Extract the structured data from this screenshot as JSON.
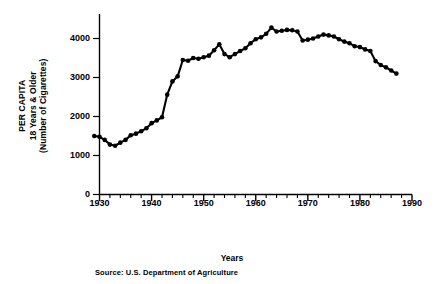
{
  "chart_data": {
    "type": "line",
    "title": "",
    "xlabel": "Years",
    "ylabel_lines": [
      "PER CAPITA",
      "18 Years & Older",
      "(Number of Cigarettes)"
    ],
    "ylabel": "PER CAPITA 18 Years & Older (Number of Cigarettes)",
    "source": "Source: U.S. Department of Agriculture",
    "xlim": [
      1928,
      1990
    ],
    "ylim": [
      0,
      4500
    ],
    "xticks": [
      1930,
      1940,
      1950,
      1960,
      1970,
      1980,
      1990
    ],
    "xtick_labels": [
      "1930",
      "1940",
      "1950",
      "1960",
      "1970",
      "1980",
      "1990"
    ],
    "minor_xtick_interval": 2,
    "yticks": [
      0,
      1000,
      2000,
      3000,
      4000
    ],
    "ytick_labels": [
      "0",
      "1000",
      "2000",
      "3000",
      "4000"
    ],
    "grid": false,
    "legend": null,
    "marker": "filled-circle",
    "line_color": "#000000",
    "series": [
      {
        "name": "Per capita cigarette consumption",
        "x": [
          1929,
          1930,
          1931,
          1932,
          1933,
          1934,
          1935,
          1936,
          1937,
          1938,
          1939,
          1940,
          1941,
          1942,
          1943,
          1944,
          1945,
          1946,
          1947,
          1948,
          1949,
          1950,
          1951,
          1952,
          1953,
          1954,
          1955,
          1956,
          1957,
          1958,
          1959,
          1960,
          1961,
          1962,
          1963,
          1964,
          1965,
          1966,
          1967,
          1968,
          1969,
          1970,
          1971,
          1972,
          1973,
          1974,
          1975,
          1976,
          1977,
          1978,
          1979,
          1980,
          1981,
          1982,
          1983,
          1984,
          1985,
          1986,
          1987
        ],
        "values": [
          1500,
          1480,
          1400,
          1280,
          1250,
          1330,
          1400,
          1520,
          1560,
          1620,
          1700,
          1830,
          1900,
          1980,
          2560,
          2900,
          3030,
          3450,
          3430,
          3500,
          3480,
          3520,
          3560,
          3700,
          3850,
          3600,
          3520,
          3600,
          3680,
          3750,
          3880,
          3980,
          4030,
          4120,
          4280,
          4180,
          4200,
          4220,
          4210,
          4180,
          3950,
          3970,
          4000,
          4050,
          4100,
          4080,
          4050,
          3980,
          3920,
          3880,
          3800,
          3780,
          3720,
          3680,
          3420,
          3320,
          3260,
          3180,
          3100
        ]
      }
    ]
  },
  "axes": {
    "y_axis_name": "cigarettes-per-capita-axis",
    "x_axis_name": "years-axis"
  }
}
